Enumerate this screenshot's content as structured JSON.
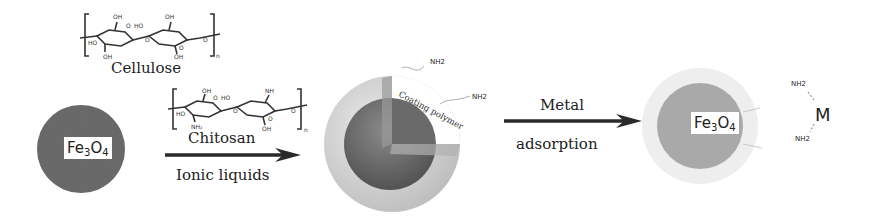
{
  "diagram": {
    "type": "reaction-scheme",
    "polymers": {
      "cellulose": {
        "name": "Cellulose",
        "repeat_subscript": "n",
        "atom_labels": [
          "OH",
          "O",
          "HO",
          "OH",
          "HO",
          "O",
          "OH",
          "O",
          "OH",
          "O"
        ]
      },
      "chitosan": {
        "name": "Chitosan",
        "repeat_subscript": "n",
        "atom_labels": [
          "OH",
          "O",
          "HO",
          "NH",
          "HO",
          "O",
          "NH2",
          "O",
          "OH",
          "O"
        ]
      }
    },
    "step1": {
      "reactant": {
        "formula_base": "Fe",
        "sub1": "3",
        "mid": "O",
        "sub2": "4"
      },
      "arrow_label_top": "Chitosan",
      "arrow_label_bottom": "Ionic liquids"
    },
    "intermediate": {
      "shell_label": "Coating polymer",
      "functional_group_1": "NH2",
      "functional_group_2": "NH2"
    },
    "step2": {
      "arrow_label_top": "Metal",
      "arrow_label_bottom": "adsorption"
    },
    "product": {
      "core": {
        "formula_base": "Fe",
        "sub1": "3",
        "mid": "O",
        "sub2": "4"
      },
      "group_top": "NH2",
      "group_bottom": "NH2",
      "metal": "M"
    },
    "colors": {
      "core_dark": "#6e6e6e",
      "shell_light": "#d9d9d9",
      "product_core": "#a9a9a9",
      "product_halo": "#ececec",
      "arrow": "#2a2a2a"
    }
  }
}
